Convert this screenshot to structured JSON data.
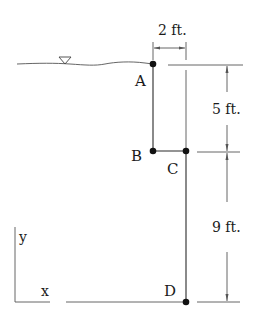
{
  "figure": {
    "type": "hydrostatics-gate-diagram",
    "points": [
      {
        "id": "A",
        "label": "A",
        "x": 153,
        "y": 64
      },
      {
        "id": "B",
        "label": "B",
        "x": 153,
        "y": 151
      },
      {
        "id": "C",
        "label": "C",
        "x": 186,
        "y": 151
      },
      {
        "id": "D",
        "label": "D",
        "x": 186,
        "y": 301
      }
    ],
    "dimensions": {
      "width_label": "2 ft.",
      "upper_height_label": "5 ft.",
      "lower_height_label": "9 ft."
    },
    "axes": {
      "x_label": "x",
      "y_label": "y"
    },
    "free_surface_symbol": "water-level-triangle"
  }
}
